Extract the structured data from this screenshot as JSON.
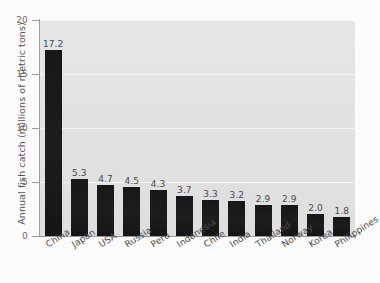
{
  "chart_data": {
    "type": "bar",
    "title": "",
    "xlabel": "",
    "ylabel": "Annual fish catch (millions of metric tons)",
    "ylim": [
      0,
      20
    ],
    "yticks": [
      "0",
      "5",
      "10",
      "15",
      "20"
    ],
    "grid": true,
    "legend": "none",
    "orientation": "vertical",
    "bar_color": "#1a1a1a",
    "plot_background": "#e3e3e3",
    "gridline_color": "#f4f4f4",
    "categories": [
      "China",
      "Japan",
      "USA",
      "Russia",
      "Peru",
      "Indonesia",
      "Chile",
      "India",
      "Thailand",
      "Norway",
      "Korea",
      "Philippines"
    ],
    "values": [
      17.2,
      5.3,
      4.7,
      4.5,
      4.3,
      3.7,
      3.3,
      3.2,
      2.9,
      2.9,
      2.0,
      1.8
    ],
    "value_labels": [
      "17.2",
      "5.3",
      "4.7",
      "4.5",
      "4.3",
      "3.7",
      "3.3",
      "3.2",
      "2.9",
      "2.9",
      "2.0",
      "1.8"
    ]
  },
  "caption": {
    "partial_text": ""
  }
}
